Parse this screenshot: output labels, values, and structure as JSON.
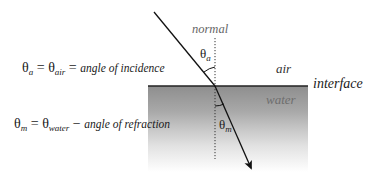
{
  "labels": {
    "normal": "normal",
    "air": "air",
    "water": "water",
    "interface": "interface"
  },
  "angle_labels": {
    "theta_a": {
      "symbol": "θ",
      "sub": "a"
    },
    "theta_m": {
      "symbol": "θ",
      "sub": "m"
    }
  },
  "equations": {
    "incidence": {
      "lhs_symbol": "θ",
      "lhs_sub": "a",
      "eq1": " = ",
      "mid_symbol": "θ",
      "mid_sub": "air",
      "eq2": " = ",
      "text": "angle of incidence"
    },
    "refraction": {
      "lhs_symbol": "θ",
      "lhs_sub": "m",
      "eq1": " = ",
      "mid_symbol": "θ",
      "mid_sub": "water",
      "eq2": " − ",
      "text": "angle of refraction"
    }
  },
  "colors": {
    "ray": "#111111",
    "normal_line": "#333333",
    "interface_line": "#222222",
    "water_top": "#8e8e8e",
    "water_bottom": "#ffffff"
  }
}
